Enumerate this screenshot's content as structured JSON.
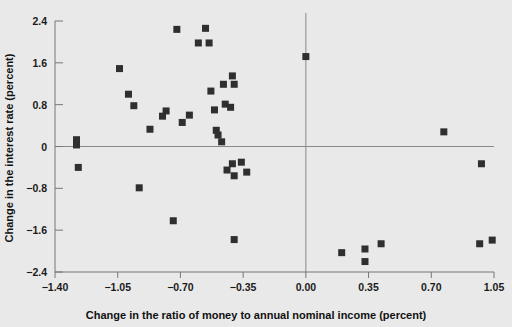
{
  "chart_data": {
    "type": "scatter",
    "title": "",
    "xlabel": "Change in the ratio of money to annual nominal income (percent)",
    "ylabel": "Change in the interest rate (percent)",
    "xlim": [
      -1.4,
      1.05
    ],
    "ylim": [
      -2.4,
      2.4
    ],
    "xticks": [
      -1.4,
      -1.05,
      -0.7,
      -0.35,
      0.0,
      0.35,
      0.7,
      1.05
    ],
    "xticklabels": [
      "−1.40",
      "−1.05",
      "−0.70",
      "−0.35",
      "0.00",
      "0.35",
      "0.70",
      "1.05"
    ],
    "yticks": [
      2.4,
      1.6,
      0.8,
      0,
      -0.8,
      -1.6,
      -2.4
    ],
    "yticklabels": [
      "2.4",
      "1.6",
      "0.8",
      "0",
      "−0.8",
      "−1.6",
      "−2.4"
    ],
    "grid": false,
    "legend": null,
    "reference_lines": [
      {
        "axis": "y",
        "value": 0
      },
      {
        "axis": "x",
        "value": 0
      }
    ],
    "marker": "square",
    "marker_color": "#2f2f2f",
    "points": [
      {
        "x": -1.28,
        "y": 0.13
      },
      {
        "x": -1.28,
        "y": 0.03
      },
      {
        "x": -1.27,
        "y": -0.4
      },
      {
        "x": -1.04,
        "y": 1.49
      },
      {
        "x": -0.99,
        "y": 1.0
      },
      {
        "x": -0.96,
        "y": 0.78
      },
      {
        "x": -0.93,
        "y": -0.79
      },
      {
        "x": -0.87,
        "y": 0.33
      },
      {
        "x": -0.8,
        "y": 0.58
      },
      {
        "x": -0.78,
        "y": 0.68
      },
      {
        "x": -0.74,
        "y": -1.42
      },
      {
        "x": -0.72,
        "y": 2.24
      },
      {
        "x": -0.69,
        "y": 0.46
      },
      {
        "x": -0.65,
        "y": 0.6
      },
      {
        "x": -0.6,
        "y": 1.98
      },
      {
        "x": -0.56,
        "y": 2.26
      },
      {
        "x": -0.54,
        "y": 1.98
      },
      {
        "x": -0.53,
        "y": 1.06
      },
      {
        "x": -0.51,
        "y": 0.7
      },
      {
        "x": -0.5,
        "y": 0.31
      },
      {
        "x": -0.49,
        "y": 0.22
      },
      {
        "x": -0.47,
        "y": 0.09
      },
      {
        "x": -0.46,
        "y": 1.19
      },
      {
        "x": -0.45,
        "y": 0.81
      },
      {
        "x": -0.42,
        "y": 0.75
      },
      {
        "x": -0.41,
        "y": 1.35
      },
      {
        "x": -0.4,
        "y": 1.19
      },
      {
        "x": -0.44,
        "y": -0.45
      },
      {
        "x": -0.41,
        "y": -0.33
      },
      {
        "x": -0.4,
        "y": -0.56
      },
      {
        "x": -0.36,
        "y": -0.3
      },
      {
        "x": -0.33,
        "y": -0.49
      },
      {
        "x": -0.4,
        "y": -1.78
      },
      {
        "x": 0.0,
        "y": 1.72
      },
      {
        "x": 0.2,
        "y": -2.03
      },
      {
        "x": 0.33,
        "y": -1.96
      },
      {
        "x": 0.33,
        "y": -2.2
      },
      {
        "x": 0.42,
        "y": -1.86
      },
      {
        "x": 0.77,
        "y": 0.28
      },
      {
        "x": 0.98,
        "y": -0.33
      },
      {
        "x": 0.97,
        "y": -1.86
      },
      {
        "x": 1.04,
        "y": -1.79
      }
    ]
  }
}
